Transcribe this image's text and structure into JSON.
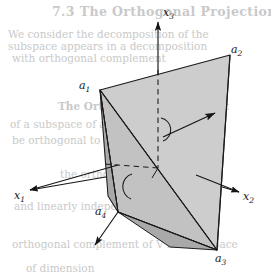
{
  "figure": {
    "type": "line-diagram",
    "background_color": "#ffffff",
    "stroke_color": "#1a1a1a",
    "face_fill_light": "#cdcdcd",
    "face_fill_mid": "#c0c0c0",
    "face_fill_dark": "#a8a8a8",
    "bleed_text_color": "#c9c9c9"
  },
  "axes": {
    "x1": {
      "label": "x",
      "sub": "1",
      "arrow": "down-left"
    },
    "x2": {
      "label": "x",
      "sub": "2",
      "arrow": "down-right"
    },
    "x3": {
      "label": "x",
      "sub": "3",
      "arrow": "up"
    }
  },
  "vertices": [
    {
      "id": "a1",
      "label": "a",
      "sub": "1",
      "x": 100,
      "y": 90
    },
    {
      "id": "a2",
      "label": "a",
      "sub": "2",
      "x": 230,
      "y": 55
    },
    {
      "id": "a3",
      "label": "a",
      "sub": "3",
      "x": 217,
      "y": 250
    },
    {
      "id": "a4",
      "label": "a",
      "sub": "4",
      "x": 118,
      "y": 212
    }
  ],
  "annotations": {
    "normal_vector": "normal-vector-arrow",
    "right_angle_upper": "perpendicular-arc",
    "right_angle_lower": "perpendicular-arc",
    "a4_direction": "a4-direction-arrow",
    "dashed_hidden_edges": "hidden-axis-dashed"
  },
  "bleed_text": {
    "l1": "7.3   The Orthogonal Projection",
    "l2": "We consider the decomposition of the",
    "l3": "subspace appears in a decomposition",
    "l4": "with orthogonal complement",
    "l5": "The Orthogonal Complement",
    "l6": "of a subspace of a finite-dimensional",
    "l7": "be orthogonal to every vector in",
    "l8": "the orthogonal",
    "l9": "and linearly independent",
    "l10": "orthogonal complement of  V  is a subspace",
    "l11": "of dimension"
  }
}
